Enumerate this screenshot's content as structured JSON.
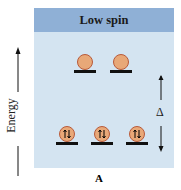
{
  "header": {
    "title": "Low spin"
  },
  "axis": {
    "energy_label": "Energy",
    "gap_label": "Δ"
  },
  "caption": {
    "label": "A"
  },
  "orbitals": {
    "upper": [
      {
        "electrons": 0
      },
      {
        "electrons": 0
      }
    ],
    "lower": [
      {
        "electrons": 2
      },
      {
        "electrons": 2
      },
      {
        "electrons": 2
      }
    ]
  },
  "colors": {
    "header": "#8fb0d6",
    "panel": "#d4e4f1",
    "orbital": "#e8a878"
  }
}
